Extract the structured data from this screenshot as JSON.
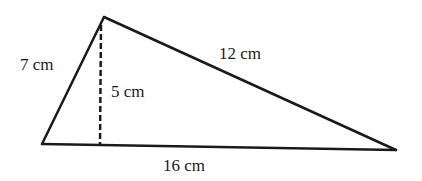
{
  "figure": {
    "shape": "triangle",
    "altitude_style": "dashed",
    "stroke_color": "#1a1a1a",
    "labels": {
      "left_side": "7 cm",
      "altitude": "5 cm",
      "right_side": "12 cm",
      "base": "16 cm"
    }
  }
}
